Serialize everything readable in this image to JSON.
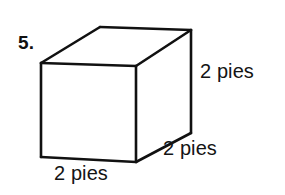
{
  "figure": {
    "problem_number": "5.",
    "shape_name": "rectangular-prism",
    "stroke_color": "#111111",
    "fill_color": "#ffffff",
    "labels": {
      "height": "2 pies",
      "depth": "2 pies",
      "width": "2 pies"
    },
    "vertices": {
      "front_top_left": [
        41,
        63
      ],
      "front_top_right": [
        136,
        66
      ],
      "front_bottom_right": [
        136,
        162
      ],
      "front_bottom_left": [
        41,
        157
      ],
      "back_top_left": [
        100,
        27
      ],
      "back_top_right": [
        191,
        30
      ],
      "back_bottom_right": [
        191,
        133
      ]
    }
  }
}
